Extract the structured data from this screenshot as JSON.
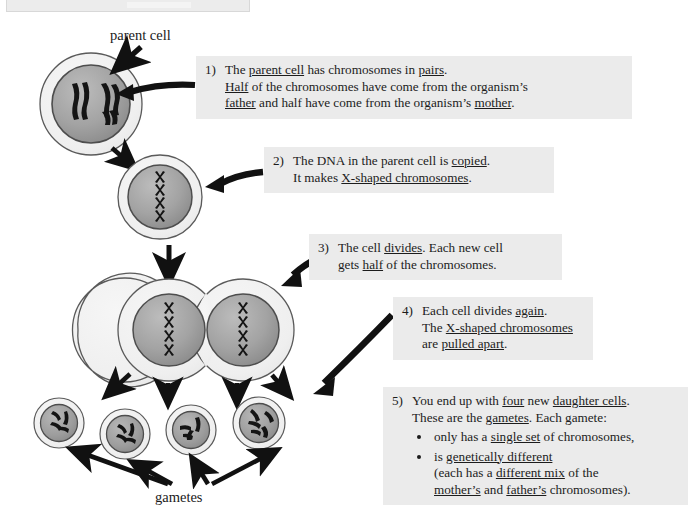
{
  "page": {
    "width": 692,
    "height": 516,
    "background": "#ffffff"
  },
  "colors": {
    "callout_background": "#ebebeb",
    "text": "#1c1c1c",
    "cytoplasm": "#efefef",
    "nucleus": "#a8a8a8",
    "nucleus_dark": "#8d8d8d",
    "chromosome": "#151515",
    "outline": "#555555",
    "arrow": "#111111"
  },
  "labels": {
    "parent_cell": "parent cell",
    "gametes": "gametes"
  },
  "callouts": [
    {
      "id": "step-1",
      "number": "1)",
      "lines": [
        [
          {
            "t": "The ",
            "u": false
          },
          {
            "t": "parent cell",
            "u": true
          },
          {
            "t": " has chromosomes in ",
            "u": false
          },
          {
            "t": "pairs",
            "u": true
          },
          {
            "t": ".",
            "u": false
          }
        ],
        [
          {
            "t": "Half",
            "u": true
          },
          {
            "t": " of the chromosomes have come from the organism’s",
            "u": false
          }
        ],
        [
          {
            "t": "father",
            "u": true
          },
          {
            "t": " and half have come from the organism’s ",
            "u": false
          },
          {
            "t": "mother",
            "u": true
          },
          {
            "t": ".",
            "u": false
          }
        ]
      ]
    },
    {
      "id": "step-2",
      "number": "2)",
      "lines": [
        [
          {
            "t": "The DNA in the parent cell is ",
            "u": false
          },
          {
            "t": "copied",
            "u": true
          },
          {
            "t": ".",
            "u": false
          }
        ],
        [
          {
            "t": "It makes ",
            "u": false
          },
          {
            "t": "X-shaped chromosomes",
            "u": true
          },
          {
            "t": ".",
            "u": false
          }
        ]
      ]
    },
    {
      "id": "step-3",
      "number": "3)",
      "lines": [
        [
          {
            "t": "The cell ",
            "u": false
          },
          {
            "t": "divides",
            "u": true
          },
          {
            "t": ".  Each new cell",
            "u": false
          }
        ],
        [
          {
            "t": "gets ",
            "u": false
          },
          {
            "t": "half",
            "u": true
          },
          {
            "t": " of the chromosomes.",
            "u": false
          }
        ]
      ]
    },
    {
      "id": "step-4",
      "number": "4)",
      "lines": [
        [
          {
            "t": "Each cell divides ",
            "u": false
          },
          {
            "t": "again",
            "u": true
          },
          {
            "t": ".",
            "u": false
          }
        ],
        [
          {
            "t": "The ",
            "u": false
          },
          {
            "t": "X-shaped chromosomes",
            "u": true
          }
        ],
        [
          {
            "t": "are ",
            "u": false
          },
          {
            "t": "pulled apart",
            "u": true
          },
          {
            "t": ".",
            "u": false
          }
        ]
      ]
    },
    {
      "id": "step-5",
      "number": "5)",
      "lines": [
        [
          {
            "t": "You end up with ",
            "u": false
          },
          {
            "t": "four",
            "u": true
          },
          {
            "t": " new ",
            "u": false
          },
          {
            "t": "daughter cells",
            "u": true
          },
          {
            "t": ".",
            "u": false
          }
        ],
        [
          {
            "t": "These are the ",
            "u": false
          },
          {
            "t": "gametes",
            "u": true
          },
          {
            "t": ".  Each gamete:",
            "u": false
          }
        ]
      ],
      "bullets": [
        {
          "lines": [
            [
              {
                "t": "only has a ",
                "u": false
              },
              {
                "t": "single set",
                "u": true
              },
              {
                "t": " of chromosomes,",
                "u": false
              }
            ]
          ]
        },
        {
          "lines": [
            [
              {
                "t": "is ",
                "u": false
              },
              {
                "t": "genetically different",
                "u": true
              }
            ],
            [
              {
                "t": "(each has a ",
                "u": false
              },
              {
                "t": "different mix",
                "u": true
              },
              {
                "t": " of the",
                "u": false
              }
            ],
            [
              {
                "t": "mother’s",
                "u": true
              },
              {
                "t": " and ",
                "u": false
              },
              {
                "t": "father’s",
                "u": true
              },
              {
                "t": " chromosomes).",
                "u": false
              }
            ]
          ]
        }
      ]
    }
  ],
  "diagram": {
    "stages": [
      {
        "name": "parent-cell",
        "cells": 1,
        "chromosome_style": "paired-rods",
        "count": 4
      },
      {
        "name": "copied-dna-cell",
        "cells": 1,
        "chromosome_style": "x-shaped-aligned",
        "count": 4
      },
      {
        "name": "two-daughter-cells",
        "cells": 2,
        "chromosome_style": "x-shaped-column",
        "count": 4
      },
      {
        "name": "four-gametes",
        "cells": 4,
        "chromosome_style": "scattered-rods",
        "count": 2
      }
    ],
    "arrows": [
      {
        "from": "parent-cell-label",
        "to": "parent-cell"
      },
      {
        "from": "callout-step-1",
        "to": "parent-cell"
      },
      {
        "from": "parent-cell",
        "to": "copied-dna-cell"
      },
      {
        "from": "callout-step-2",
        "to": "copied-dna-cell"
      },
      {
        "from": "copied-dna-cell",
        "to": "two-daughter-cells"
      },
      {
        "from": "callout-step-3",
        "to": "two-daughter-cells"
      },
      {
        "from": "callout-step-4",
        "to": "four-gametes"
      },
      {
        "from": "two-daughter-cells",
        "to": "gamete-1"
      },
      {
        "from": "two-daughter-cells",
        "to": "gamete-2"
      },
      {
        "from": "two-daughter-cells",
        "to": "gamete-3"
      },
      {
        "from": "two-daughter-cells",
        "to": "gamete-4"
      },
      {
        "from": "gametes-label",
        "to": "gamete-1"
      },
      {
        "from": "gametes-label",
        "to": "gamete-2"
      },
      {
        "from": "gametes-label",
        "to": "gamete-3"
      },
      {
        "from": "gametes-label",
        "to": "gamete-4"
      }
    ]
  }
}
